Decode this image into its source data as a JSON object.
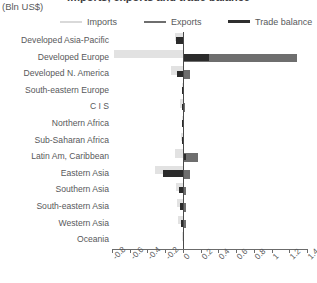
{
  "header": {
    "title": "Imports, exports and trade balance",
    "units": "(Bln US$)"
  },
  "legend": {
    "items": [
      {
        "label": "Imports",
        "color": "#d9d9d9"
      },
      {
        "label": "Exports",
        "color": "#6e6e6e"
      },
      {
        "label": "Trade balance",
        "color": "#2f2f2f"
      }
    ]
  },
  "chart_data": {
    "type": "bar",
    "orientation": "horizontal",
    "title": "Imports, exports and trade balance",
    "subtitle": "(Bln US$)",
    "xlabel": "",
    "ylabel": "",
    "units": "Bln US$",
    "xlim": [
      -0.8,
      1.4
    ],
    "xticks": [
      -0.8,
      -0.6,
      -0.4,
      -0.2,
      0,
      0.2,
      0.4,
      0.6,
      0.8,
      1,
      1.2,
      1.4
    ],
    "xticklabels": [
      "-0.8",
      "-0.6",
      "-0.4",
      "-0.2",
      "0",
      "0.2",
      "0.4",
      "0.6",
      "0.8",
      "1",
      "1.2",
      "1.4"
    ],
    "grid": false,
    "legend_position": "top",
    "categories": [
      "Developed Asia-Pacific",
      "Developed Europe",
      "Developed N. America",
      "South-eastern Europe",
      "C I S",
      "Northern Africa",
      "Sub-Saharan Africa",
      "Latin Am, Caribbean",
      "Eastern Asia",
      "Southern Asia",
      "South-eastern Asia",
      "Western Asia",
      "Oceania"
    ],
    "series": [
      {
        "name": "Imports",
        "color": "#e2e2e2",
        "values": [
          -0.09,
          -0.78,
          -0.14,
          -0.015,
          -0.03,
          -0.015,
          -0.02,
          -0.09,
          -0.32,
          -0.08,
          -0.07,
          -0.05,
          -0.005
        ]
      },
      {
        "name": "Exports",
        "color": "#6e6e6e",
        "values": [
          0.015,
          1.29,
          0.075,
          0.008,
          0.02,
          0.008,
          0.012,
          0.17,
          0.085,
          0.04,
          0.04,
          0.035,
          0.004
        ]
      },
      {
        "name": "Trade balance",
        "color": "#2b2b2b",
        "values": [
          -0.075,
          0.3,
          -0.07,
          -0.008,
          -0.012,
          -0.008,
          -0.01,
          0.04,
          -0.23,
          -0.04,
          -0.035,
          -0.02,
          -0.002
        ]
      }
    ]
  }
}
